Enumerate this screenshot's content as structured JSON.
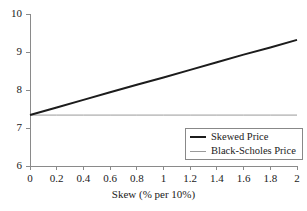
{
  "chart_data": {
    "type": "line",
    "title": "",
    "xlabel": "Skew (% per 10%)",
    "ylabel": "",
    "xlim": [
      0,
      2
    ],
    "ylim": [
      6,
      10
    ],
    "xticks": [
      "0",
      "0.2",
      "0.4",
      "0.6",
      "0.8",
      "1",
      "1.2",
      "1.4",
      "1.6",
      "1.8",
      "2"
    ],
    "xtick_values": [
      0,
      0.2,
      0.4,
      0.6,
      0.8,
      1,
      1.2,
      1.4,
      1.6,
      1.8,
      2
    ],
    "yticks": [
      "6",
      "7",
      "8",
      "9",
      "10"
    ],
    "ytick_values": [
      6,
      7,
      8,
      9,
      10
    ],
    "grid": false,
    "legend_position": "lower right",
    "x": [
      0,
      0.2,
      0.4,
      0.6,
      0.8,
      1,
      1.2,
      1.4,
      1.6,
      1.8,
      2
    ],
    "series": [
      {
        "name": "Skewed Price",
        "color": "#1c1c1c",
        "width": 2,
        "values": [
          7.34,
          7.54,
          7.74,
          7.94,
          8.14,
          8.33,
          8.53,
          8.73,
          8.93,
          9.12,
          9.32
        ]
      },
      {
        "name": "Black-Scholes Price",
        "color": "#9a9a9a",
        "width": 1,
        "values": [
          7.34,
          7.34,
          7.34,
          7.34,
          7.34,
          7.34,
          7.34,
          7.34,
          7.34,
          7.34,
          7.34
        ]
      }
    ]
  },
  "legend": {
    "entries": [
      {
        "label": "Skewed Price"
      },
      {
        "label": "Black-Scholes Price"
      }
    ]
  },
  "axes": {
    "axis_color": "#8a8a8a",
    "x_title": "Skew (% per 10%)"
  }
}
